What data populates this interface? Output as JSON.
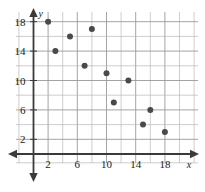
{
  "chart_data": {
    "type": "scatter",
    "title": "",
    "xlabel": "x",
    "ylabel": "y",
    "xlim": [
      0,
      19.5
    ],
    "ylim": [
      0,
      19.5
    ],
    "grid": true,
    "legend": null,
    "x_ticks": [
      2,
      6,
      10,
      14,
      18
    ],
    "y_ticks": [
      2,
      6,
      10,
      14,
      18
    ],
    "x_tick_labels": [
      "2",
      "6",
      "10",
      "14",
      "18"
    ],
    "y_tick_labels": [
      "2",
      "6",
      "10",
      "14",
      "18"
    ],
    "gridline_step": 2,
    "series": [
      {
        "name": "data",
        "marker": "circle",
        "color": "#4a4a4a",
        "points": [
          {
            "x": 2,
            "y": 18
          },
          {
            "x": 3,
            "y": 14
          },
          {
            "x": 5,
            "y": 16
          },
          {
            "x": 7,
            "y": 12
          },
          {
            "x": 8,
            "y": 17
          },
          {
            "x": 10,
            "y": 11
          },
          {
            "x": 11,
            "y": 7
          },
          {
            "x": 13,
            "y": 10
          },
          {
            "x": 15,
            "y": 4
          },
          {
            "x": 16,
            "y": 6
          },
          {
            "x": 18,
            "y": 3
          }
        ]
      }
    ]
  },
  "axes": {
    "x_axis_label": "x",
    "y_axis_label": "y"
  }
}
